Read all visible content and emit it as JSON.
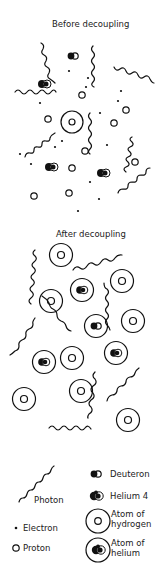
{
  "panels": {
    "before": {
      "title": "Before decoupling"
    },
    "after": {
      "title": "After decoupling"
    }
  },
  "legend": {
    "photon": "Photon",
    "electron": "Electron",
    "proton": "Proton",
    "deuteron": "Deuteron",
    "helium4": "Helium 4",
    "hydrogen_line1": "Atom of",
    "hydrogen_line2": "hydrogen",
    "helium_atom_line1": "Atom of",
    "helium_atom_line2": "helium"
  },
  "colors": {
    "ink": "#111111",
    "background": "#ffffff"
  }
}
